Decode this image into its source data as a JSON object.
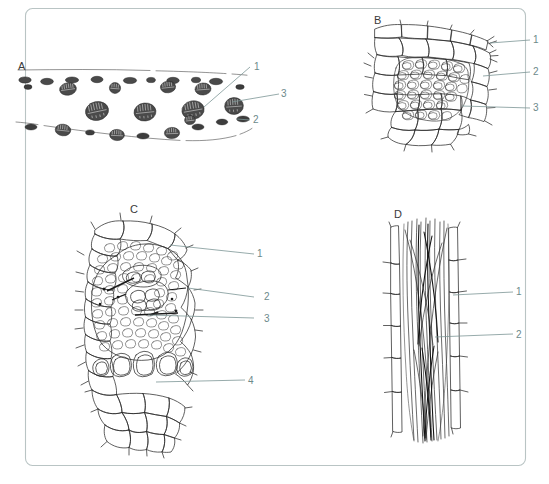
{
  "plate": {
    "frame_color": "#b9c4c4",
    "ink_color": "#2b2b2b",
    "label_color": "#6d8a8a",
    "letter_color": "#3a3a3a",
    "background": "#ffffff"
  },
  "panels": [
    {
      "letter": "A",
      "name": "surface-view-epidermis-stomata",
      "labels": [
        {
          "number": "1"
        },
        {
          "number": "3"
        },
        {
          "number": "2"
        }
      ]
    },
    {
      "letter": "B",
      "name": "transverse-section-sclerenchyma-strand",
      "labels": [
        {
          "number": "1"
        },
        {
          "number": "2"
        },
        {
          "number": "3"
        }
      ]
    },
    {
      "letter": "C",
      "name": "transverse-section-vascular-bundle",
      "labels": [
        {
          "number": "1"
        },
        {
          "number": "2"
        },
        {
          "number": "3"
        },
        {
          "number": "4"
        }
      ]
    },
    {
      "letter": "D",
      "name": "longitudinal-section-fibre-bundle",
      "labels": [
        {
          "number": "1"
        },
        {
          "number": "2"
        }
      ]
    }
  ],
  "caption": {
    "text": ""
  }
}
